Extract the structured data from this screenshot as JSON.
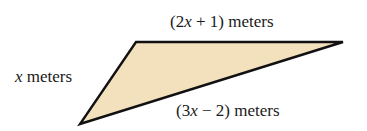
{
  "diagram": {
    "shape": "triangle",
    "fill_color": "#f3e0bd",
    "stroke_color": "#111111",
    "vertices": [
      [
        136,
        42
      ],
      [
        343,
        42
      ],
      [
        80,
        124
      ]
    ],
    "labels": {
      "top": {
        "pre": "(2",
        "var": "x",
        "post": " + 1) meters"
      },
      "left": {
        "pre": "",
        "var": "x",
        "post": " meters"
      },
      "bottom": {
        "pre": "(3",
        "var": "x",
        "post": " − 2) meters"
      }
    }
  }
}
